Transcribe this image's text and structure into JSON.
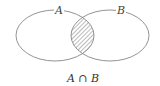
{
  "diagram": {
    "type": "venn",
    "sets": [
      {
        "label": "A"
      },
      {
        "label": "B"
      }
    ],
    "shaded_region": "intersection",
    "caption": "A ∩ B"
  },
  "colors": {
    "stroke": "#777777",
    "hatch": "#555555",
    "background": "#ffffff"
  }
}
